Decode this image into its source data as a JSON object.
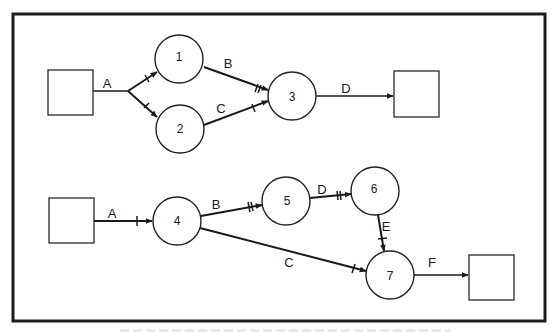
{
  "diagram": {
    "frame": {
      "x": 13,
      "y": 14,
      "width": 532,
      "height": 307
    },
    "colors": {
      "stroke": "#1a1a1a",
      "background": "#ffffff"
    },
    "top_network": {
      "boxes": [
        {
          "id": "start-top",
          "x": 48,
          "y": 70,
          "w": 45,
          "h": 45
        },
        {
          "id": "end-top",
          "x": 394,
          "y": 71,
          "w": 45,
          "h": 46
        }
      ],
      "nodes": [
        {
          "id": "1",
          "label": "1",
          "cx": 179,
          "cy": 59,
          "r": 24
        },
        {
          "id": "2",
          "label": "2",
          "cx": 180,
          "cy": 129,
          "r": 24
        },
        {
          "id": "3",
          "label": "3",
          "cx": 292,
          "cy": 96,
          "r": 24
        }
      ],
      "edges": [
        {
          "id": "A",
          "label": "A",
          "label_x": 107,
          "label_y": 83
        },
        {
          "id": "B",
          "label": "B",
          "label_x": 228,
          "label_y": 63
        },
        {
          "id": "C",
          "label": "C",
          "label_x": 221,
          "label_y": 108
        },
        {
          "id": "D",
          "label": "D",
          "label_x": 346,
          "label_y": 88
        }
      ]
    },
    "bottom_network": {
      "boxes": [
        {
          "id": "start-bottom",
          "x": 49,
          "y": 198,
          "w": 45,
          "h": 45
        },
        {
          "id": "end-bottom",
          "x": 469,
          "y": 255,
          "w": 45,
          "h": 45
        }
      ],
      "nodes": [
        {
          "id": "4",
          "label": "4",
          "cx": 177,
          "cy": 221,
          "r": 24
        },
        {
          "id": "5",
          "label": "5",
          "cx": 286,
          "cy": 201,
          "r": 24
        },
        {
          "id": "6",
          "label": "6",
          "cx": 375,
          "cy": 191,
          "r": 24
        },
        {
          "id": "7",
          "label": "7",
          "cx": 390,
          "cy": 275,
          "r": 24
        }
      ],
      "edges": [
        {
          "id": "A",
          "label": "A",
          "label_x": 112,
          "label_y": 213
        },
        {
          "id": "B",
          "label": "B",
          "label_x": 216,
          "label_y": 204
        },
        {
          "id": "C",
          "label": "C",
          "label_x": 289,
          "label_y": 262
        },
        {
          "id": "D",
          "label": "D",
          "label_x": 322,
          "label_y": 189
        },
        {
          "id": "E",
          "label": "E",
          "label_x": 386,
          "label_y": 226
        },
        {
          "id": "F",
          "label": "F",
          "label_x": 432,
          "label_y": 262
        }
      ]
    }
  }
}
